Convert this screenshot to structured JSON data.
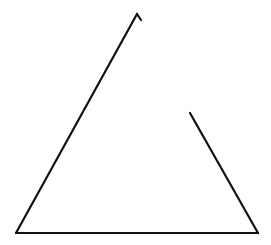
{
  "canvas": {
    "width": 271,
    "height": 245,
    "background": "#ffffff"
  },
  "stroke": {
    "color": "#111111",
    "width": 2.2
  },
  "shapes": {
    "left_edge": {
      "x1": 16,
      "y1": 233,
      "x2": 137,
      "y2": 14
    },
    "top_hook": {
      "x1": 137,
      "y1": 14,
      "x2": 141,
      "y2": 20
    },
    "bottom_edge": {
      "x1": 16,
      "y1": 233,
      "x2": 258,
      "y2": 233
    },
    "right_edge": {
      "x1": 258,
      "y1": 233,
      "x2": 190,
      "y2": 113
    }
  }
}
